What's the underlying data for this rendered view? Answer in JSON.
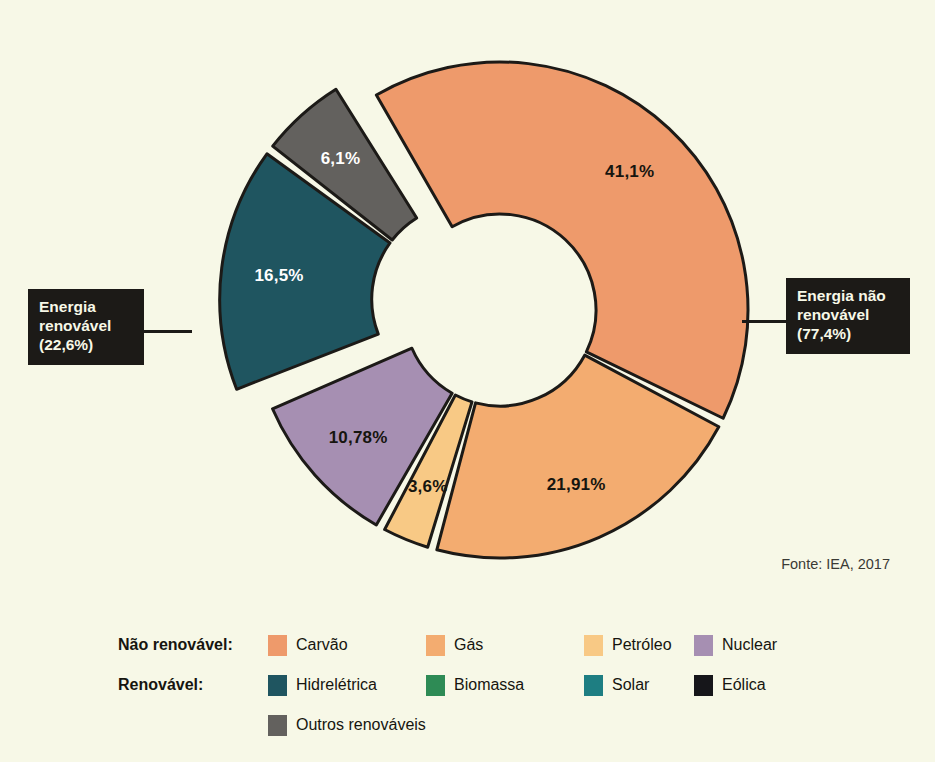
{
  "background_color": "#F7F8E7",
  "source_note": "Fonte: IEA, 2017",
  "callouts": {
    "renewable": {
      "label": "Energia\nrenovável\n(22,6%)",
      "name": "Energia renovável",
      "value": 22.6
    },
    "non_renewable": {
      "label": "Energia não\nrenovável\n(77,4%)",
      "name": "Energia não renovável",
      "value": 77.4
    }
  },
  "legend": {
    "rows": [
      {
        "title": "Não renovável:",
        "items": [
          {
            "label": "Carvão",
            "color": "#EE9A6B"
          },
          {
            "label": "Gás",
            "color": "#F3AC70"
          },
          {
            "label": "Petróleo",
            "color": "#F8C985"
          },
          {
            "label": "Nuclear",
            "color": "#A68FB2"
          }
        ]
      },
      {
        "title": "Renovável:",
        "items": [
          {
            "label": "Hidrelétrica",
            "color": "#1F5560"
          },
          {
            "label": "Biomassa",
            "color": "#2E8B55"
          },
          {
            "label": "Solar",
            "color": "#1E7E82"
          },
          {
            "label": "Eólica",
            "color": "#16161A"
          }
        ]
      },
      {
        "title": "",
        "items": [
          {
            "label": "Outros renováveis",
            "color": "#63615E"
          }
        ]
      }
    ]
  },
  "chart_data": {
    "type": "pie",
    "title": "",
    "subtitle": "",
    "xlabel": "",
    "ylabel": "",
    "legend_position": "bottom",
    "donut": true,
    "units": "%",
    "groups": [
      {
        "name": "Energia não renovável",
        "value": 77.4,
        "exploded": false
      },
      {
        "name": "Energia renovável",
        "value": 22.6,
        "exploded": true
      }
    ],
    "categories": [
      "Carvão",
      "Gás",
      "Petróleo",
      "Nuclear",
      "Hidrelétrica",
      "Outros renováveis"
    ],
    "values": [
      41.1,
      21.91,
      3.6,
      10.78,
      16.5,
      6.1
    ],
    "labels": [
      "41,1%",
      "21,91%",
      "3,6%",
      "10,78%",
      "16,5%",
      "6,1%"
    ],
    "colors": [
      "#EE9A6B",
      "#F3AC70",
      "#F8C985",
      "#A68FB2",
      "#1F5560",
      "#63615E"
    ],
    "label_colors": [
      "#16150F",
      "#16150F",
      "#16150F",
      "#16150F",
      "#FFFFFF",
      "#FFFFFF"
    ],
    "groups_of": [
      "Energia não renovável",
      "Energia não renovável",
      "Energia não renovável",
      "Energia não renovável",
      "Energia renovável",
      "Energia renovável"
    ]
  }
}
